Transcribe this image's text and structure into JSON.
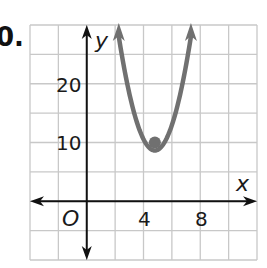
{
  "problem": {
    "number_label": "0."
  },
  "chart_data": {
    "type": "line",
    "title": "",
    "xlabel": "x",
    "ylabel": "y",
    "origin_label": "O",
    "x_ticks": [
      4,
      8
    ],
    "y_ticks": [
      10,
      20
    ],
    "x_tick_labels": [
      "4",
      "8"
    ],
    "y_tick_labels": [
      "10",
      "20"
    ],
    "grid": true,
    "grid_x_step": 2,
    "grid_y_step": 5,
    "xlim": [
      -4,
      12
    ],
    "ylim": [
      -10,
      30
    ],
    "series": [
      {
        "name": "parabola",
        "equation_estimate": "y = 3(x - 4.8)^2 + 10",
        "vertex": [
          4.8,
          10
        ],
        "a": 3,
        "arrows_both_ends": true,
        "color": "#707070"
      }
    ],
    "points": [
      {
        "label": "vertex",
        "x": 4.8,
        "y": 10,
        "color": "#707070"
      }
    ],
    "axis_color": "#111111",
    "grid_color": "#c8c8c8"
  }
}
